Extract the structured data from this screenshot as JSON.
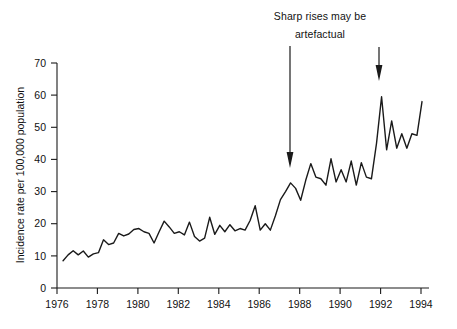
{
  "chart_data": {
    "type": "line",
    "title": "",
    "xlabel": "",
    "ylabel": "Incidence rate per 100,000 population",
    "xlim": [
      1976,
      1994
    ],
    "ylim": [
      0,
      70
    ],
    "grid": false,
    "legend": "none",
    "x_ticks": [
      "1976",
      "1978",
      "1980",
      "1982",
      "1984",
      "1986",
      "1988",
      "1990",
      "1992",
      "1994"
    ],
    "x_tick_values": [
      1976,
      1978,
      1980,
      1982,
      1984,
      1986,
      1988,
      1990,
      1992,
      1994
    ],
    "y_ticks": [
      "0",
      "10",
      "20",
      "30",
      "40",
      "50",
      "60",
      "70"
    ],
    "y_tick_values": [
      0,
      10,
      20,
      30,
      40,
      50,
      60,
      70
    ],
    "line_color": "#1a1a1a",
    "series": [
      {
        "name": "Incidence rate",
        "x": [
          1976.3,
          1976.55,
          1976.8,
          1977.05,
          1977.3,
          1977.55,
          1977.8,
          1978.05,
          1978.3,
          1978.55,
          1978.8,
          1979.05,
          1979.3,
          1979.55,
          1979.8,
          1980.05,
          1980.3,
          1980.55,
          1980.8,
          1981.05,
          1981.3,
          1981.55,
          1981.8,
          1982.05,
          1982.3,
          1982.55,
          1982.8,
          1983.05,
          1983.3,
          1983.55,
          1983.8,
          1984.05,
          1984.3,
          1984.55,
          1984.8,
          1985.05,
          1985.3,
          1985.55,
          1985.8,
          1986.05,
          1986.3,
          1986.55,
          1986.8,
          1987.05,
          1987.3,
          1987.55,
          1987.8,
          1988.05,
          1988.3,
          1988.55,
          1988.8,
          1989.05,
          1989.3,
          1989.55,
          1989.8,
          1990.05,
          1990.3,
          1990.55,
          1990.8,
          1991.05,
          1991.3,
          1991.55,
          1991.8,
          1992.05,
          1992.3,
          1992.55,
          1992.8,
          1993.05,
          1993.3,
          1993.55,
          1993.8,
          1994.05
        ],
        "values": [
          8.5,
          10.3,
          11.6,
          10.3,
          11.5,
          9.6,
          10.6,
          11.0,
          15.0,
          13.5,
          14.0,
          17.0,
          16.2,
          16.8,
          18.2,
          18.5,
          17.5,
          17.0,
          14.0,
          17.5,
          20.8,
          19.0,
          17.0,
          17.5,
          16.5,
          20.5,
          16.0,
          14.6,
          15.5,
          22.0,
          16.7,
          19.5,
          17.5,
          19.7,
          17.8,
          18.5,
          18.0,
          21.0,
          25.6,
          18.0,
          20.0,
          18.0,
          22.5,
          27.5,
          30.0,
          32.7,
          31.0,
          27.3,
          33.5,
          38.7,
          34.5,
          34.0,
          32.0,
          40.2,
          33.0,
          36.8,
          33.0,
          39.5,
          32.0,
          39.0,
          34.5,
          34.0,
          45.0,
          59.5,
          43.0,
          52.0,
          43.5,
          48.0,
          43.5,
          48.0,
          47.5,
          58.0
        ]
      }
    ],
    "annotations": [
      {
        "name": "callout-text",
        "line_1": "Sharp rises may be",
        "line_2": "artefactual"
      },
      {
        "name": "arrow-left",
        "points_to_x": 1987.3,
        "points_to_y": 38.0
      },
      {
        "name": "arrow-right",
        "points_to_x": 1991.9,
        "points_to_y": 64.5
      }
    ]
  }
}
